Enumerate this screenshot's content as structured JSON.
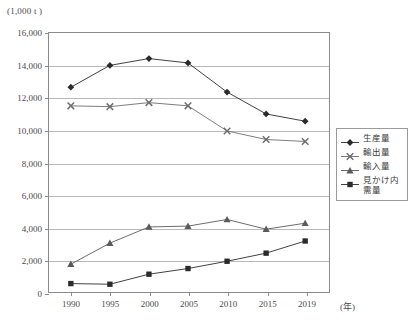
{
  "chart_data": {
    "type": "line",
    "title": "",
    "unit_label": "(1,000 t )",
    "xlabel": "(年)",
    "ylabel": "",
    "categories": [
      "1990",
      "1995",
      "2000",
      "2005",
      "2010",
      "2015",
      "2019"
    ],
    "ylim": [
      0,
      16000
    ],
    "ytick_step": 2000,
    "yticks": [
      "0",
      "2,000",
      "4,000",
      "6,000",
      "8,000",
      "10,000",
      "12,000",
      "14,000",
      "16,000"
    ],
    "ytick_values": [
      0,
      2000,
      4000,
      6000,
      8000,
      10000,
      12000,
      14000,
      16000
    ],
    "grid": true,
    "legend_position": "right",
    "series": [
      {
        "name": "生産量",
        "marker": "diamond",
        "color": "#2b2b2b",
        "values": [
          12650,
          14000,
          14420,
          14150,
          12350,
          11000,
          10550
        ]
      },
      {
        "name": "輸出量",
        "marker": "x",
        "color": "#6e6e6e",
        "values": [
          11500,
          11450,
          11700,
          11500,
          9950,
          9420,
          9300
        ]
      },
      {
        "name": "輸入量",
        "marker": "triangle",
        "color": "#5a5a5a",
        "values": [
          1720,
          3020,
          4020,
          4070,
          4480,
          3880,
          4250
        ]
      },
      {
        "name": "見かけ内需量",
        "marker": "square",
        "color": "#2b2b2b",
        "values": [
          520,
          480,
          1100,
          1450,
          1900,
          2400,
          3150
        ]
      }
    ]
  },
  "legend": {
    "items": [
      {
        "label": "生産量",
        "marker": "diamond"
      },
      {
        "label": "輸出量",
        "marker": "x"
      },
      {
        "label": "輸入量",
        "marker": "triangle"
      },
      {
        "label": "見かけ内\n需量",
        "marker": "square"
      }
    ]
  }
}
